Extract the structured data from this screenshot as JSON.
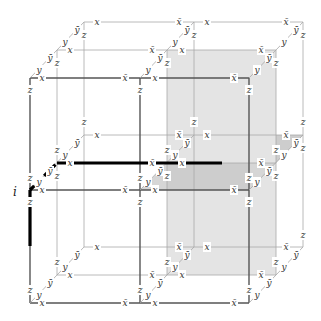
{
  "diagram": {
    "title_label": "i",
    "colors": {
      "thin_line": "#a8a8a8",
      "front_line": "#555555",
      "thick_line": "#000000",
      "shade_light": "#e2e2e2",
      "shade_dark": "#cfcfcf"
    },
    "layers": {
      "front": {
        "xs": [
          30,
          140,
          249
        ],
        "ys": [
          78,
          190,
          303
        ]
      },
      "middle": {
        "xs": [
          57,
          167,
          276
        ],
        "ys": [
          50,
          163,
          275
        ]
      },
      "back": {
        "xs": [
          84,
          194,
          303
        ],
        "ys": [
          22,
          135,
          247
        ]
      }
    },
    "labels": [
      {
        "t": "x",
        "x": 42,
        "y": 78
      },
      {
        "t": "x̄",
        "x": 125,
        "y": 78
      },
      {
        "t": "x",
        "x": 155,
        "y": 78
      },
      {
        "t": "x̄",
        "x": 234,
        "y": 78
      },
      {
        "t": "x",
        "x": 70,
        "y": 50
      },
      {
        "t": "x̄",
        "x": 152,
        "y": 50
      },
      {
        "t": "x",
        "x": 182,
        "y": 50
      },
      {
        "t": "x̄",
        "x": 261,
        "y": 50
      },
      {
        "t": "x",
        "x": 97,
        "y": 22
      },
      {
        "t": "x̄",
        "x": 179,
        "y": 22
      },
      {
        "t": "x",
        "x": 207,
        "y": 22
      },
      {
        "t": "x̄",
        "x": 286,
        "y": 22
      },
      {
        "t": "x",
        "x": 42,
        "y": 190
      },
      {
        "t": "x̄",
        "x": 125,
        "y": 190
      },
      {
        "t": "x",
        "x": 155,
        "y": 190
      },
      {
        "t": "x̄",
        "x": 234,
        "y": 190
      },
      {
        "t": "x",
        "x": 70,
        "y": 163
      },
      {
        "t": "x̄",
        "x": 152,
        "y": 163
      },
      {
        "t": "x",
        "x": 182,
        "y": 163
      },
      {
        "t": "x̄",
        "x": 261,
        "y": 163
      },
      {
        "t": "x",
        "x": 97,
        "y": 135
      },
      {
        "t": "x̄",
        "x": 179,
        "y": 135
      },
      {
        "t": "x",
        "x": 207,
        "y": 135
      },
      {
        "t": "x̄",
        "x": 286,
        "y": 135
      },
      {
        "t": "x",
        "x": 42,
        "y": 303
      },
      {
        "t": "x̄",
        "x": 125,
        "y": 303
      },
      {
        "t": "x",
        "x": 155,
        "y": 303
      },
      {
        "t": "x̄",
        "x": 234,
        "y": 303
      },
      {
        "t": "x",
        "x": 70,
        "y": 275
      },
      {
        "t": "x̄",
        "x": 152,
        "y": 275
      },
      {
        "t": "x",
        "x": 182,
        "y": 275
      },
      {
        "t": "x̄",
        "x": 261,
        "y": 275
      },
      {
        "t": "x",
        "x": 97,
        "y": 247
      },
      {
        "t": "x̄",
        "x": 179,
        "y": 247
      },
      {
        "t": "x",
        "x": 207,
        "y": 247
      },
      {
        "t": "x̄",
        "x": 286,
        "y": 247
      },
      {
        "t": "y",
        "x": 39,
        "y": 70
      },
      {
        "t": "ȳ",
        "x": 50,
        "y": 58
      },
      {
        "t": "y",
        "x": 65,
        "y": 42
      },
      {
        "t": "ȳ",
        "x": 77,
        "y": 30
      },
      {
        "t": "y",
        "x": 148,
        "y": 70
      },
      {
        "t": "ȳ",
        "x": 160,
        "y": 58
      },
      {
        "t": "y",
        "x": 175,
        "y": 42
      },
      {
        "t": "ȳ",
        "x": 187,
        "y": 30
      },
      {
        "t": "y",
        "x": 257,
        "y": 70
      },
      {
        "t": "ȳ",
        "x": 269,
        "y": 58
      },
      {
        "t": "y",
        "x": 284,
        "y": 42
      },
      {
        "t": "ȳ",
        "x": 296,
        "y": 30
      },
      {
        "t": "y",
        "x": 39,
        "y": 182
      },
      {
        "t": "ȳ",
        "x": 50,
        "y": 171
      },
      {
        "t": "y",
        "x": 65,
        "y": 155
      },
      {
        "t": "ȳ",
        "x": 77,
        "y": 143
      },
      {
        "t": "y",
        "x": 148,
        "y": 182
      },
      {
        "t": "ȳ",
        "x": 160,
        "y": 171
      },
      {
        "t": "y",
        "x": 175,
        "y": 155
      },
      {
        "t": "ȳ",
        "x": 187,
        "y": 143
      },
      {
        "t": "y",
        "x": 257,
        "y": 182
      },
      {
        "t": "ȳ",
        "x": 269,
        "y": 171
      },
      {
        "t": "y",
        "x": 284,
        "y": 155
      },
      {
        "t": "ȳ",
        "x": 296,
        "y": 143
      },
      {
        "t": "y",
        "x": 39,
        "y": 295
      },
      {
        "t": "ȳ",
        "x": 50,
        "y": 283
      },
      {
        "t": "y",
        "x": 65,
        "y": 267
      },
      {
        "t": "ȳ",
        "x": 77,
        "y": 255
      },
      {
        "t": "y",
        "x": 148,
        "y": 295
      },
      {
        "t": "ȳ",
        "x": 160,
        "y": 283
      },
      {
        "t": "y",
        "x": 175,
        "y": 267
      },
      {
        "t": "ȳ",
        "x": 187,
        "y": 255
      },
      {
        "t": "y",
        "x": 257,
        "y": 295
      },
      {
        "t": "ȳ",
        "x": 269,
        "y": 283
      },
      {
        "t": "y",
        "x": 284,
        "y": 267
      },
      {
        "t": "ȳ",
        "x": 296,
        "y": 255
      },
      {
        "t": "z",
        "x": 30,
        "y": 90
      },
      {
        "t": "z",
        "x": 30,
        "y": 178
      },
      {
        "t": "z",
        "x": 30,
        "y": 202
      },
      {
        "t": "z",
        "x": 30,
        "y": 290
      },
      {
        "t": "z",
        "x": 140,
        "y": 90
      },
      {
        "t": "z",
        "x": 140,
        "y": 178
      },
      {
        "t": "z",
        "x": 140,
        "y": 202
      },
      {
        "t": "z",
        "x": 140,
        "y": 290
      },
      {
        "t": "z",
        "x": 249,
        "y": 90
      },
      {
        "t": "z",
        "x": 249,
        "y": 178
      },
      {
        "t": "z",
        "x": 249,
        "y": 202
      },
      {
        "t": "z",
        "x": 249,
        "y": 290
      },
      {
        "t": "z",
        "x": 57,
        "y": 63
      },
      {
        "t": "z",
        "x": 57,
        "y": 150
      },
      {
        "t": "z",
        "x": 57,
        "y": 176
      },
      {
        "t": "z",
        "x": 57,
        "y": 262
      },
      {
        "t": "z",
        "x": 167,
        "y": 63
      },
      {
        "t": "z",
        "x": 167,
        "y": 150
      },
      {
        "t": "z",
        "x": 167,
        "y": 176
      },
      {
        "t": "z",
        "x": 167,
        "y": 262
      },
      {
        "t": "z",
        "x": 276,
        "y": 63
      },
      {
        "t": "z",
        "x": 276,
        "y": 150
      },
      {
        "t": "z",
        "x": 276,
        "y": 176
      },
      {
        "t": "z",
        "x": 276,
        "y": 262
      },
      {
        "t": "z",
        "x": 84,
        "y": 35
      },
      {
        "t": "z",
        "x": 84,
        "y": 122
      },
      {
        "t": "z",
        "x": 194,
        "y": 35
      },
      {
        "t": "z",
        "x": 194,
        "y": 122
      },
      {
        "t": "z",
        "x": 303,
        "y": 35
      },
      {
        "t": "z",
        "x": 303,
        "y": 122
      },
      {
        "t": "z",
        "x": 303,
        "y": 148
      },
      {
        "t": "z",
        "x": 303,
        "y": 235
      }
    ]
  }
}
